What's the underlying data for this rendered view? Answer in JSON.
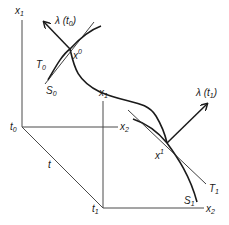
{
  "figure": {
    "labels": {
      "x1_left": "x",
      "x1_left_sub": "1",
      "x2_mid": "x",
      "x2_mid_sub": "2",
      "t0": "t",
      "t0_sub": "0",
      "t_axis": "t",
      "t1": "t",
      "t1_sub": "1",
      "x1_right": "x",
      "x1_right_sub": "1",
      "x2_right": "x",
      "x2_right_sub": "2",
      "lambda_t0": "λ (t",
      "lambda_t0_sub": "0",
      "lambda_t0_close": ")",
      "lambda_t1": "λ (t",
      "lambda_t1_sub": "1",
      "lambda_t1_close": ")",
      "x0_point": "x",
      "x0_sup": "0",
      "x1_point": "x",
      "x1_sup": "1",
      "T0": "T",
      "T0_sub": "0",
      "S0": "S",
      "S0_sub": "0",
      "T1": "T",
      "T1_sub": "1",
      "S1": "S",
      "S1_sub": "1"
    },
    "colors": {
      "line": "#1a1a1a",
      "axis": "#4a4a4a",
      "background": "#ffffff"
    }
  }
}
